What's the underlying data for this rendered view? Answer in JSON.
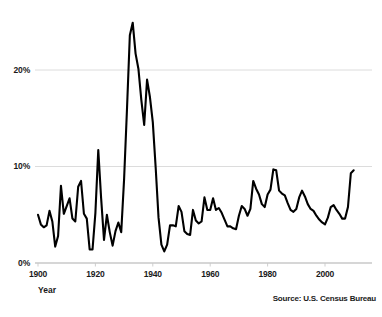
{
  "chart_data": {
    "type": "line",
    "title": "",
    "xlabel": "Year",
    "ylabel": "",
    "xlim": [
      1900,
      2010
    ],
    "ylim": [
      0,
      27
    ],
    "grid": true,
    "legend": "none",
    "source_note": "Source: U.S. Census Bureau",
    "y_tick_labels": [
      "0%",
      "10%",
      "20%"
    ],
    "y_ticks": [
      0,
      10,
      20
    ],
    "x_tick_labels": [
      "1900",
      "1920",
      "1940",
      "1960",
      "1980",
      "2000"
    ],
    "x_ticks": [
      1900,
      1920,
      1940,
      1960,
      1980,
      2000
    ],
    "line_color": "#000000",
    "grid_color": "#d8d8d8",
    "axis_color": "#c9c9c9",
    "series": [
      {
        "name": "Unemployment rate",
        "x": [
          1900,
          1901,
          1902,
          1903,
          1904,
          1905,
          1906,
          1907,
          1908,
          1909,
          1910,
          1911,
          1912,
          1913,
          1914,
          1915,
          1916,
          1917,
          1918,
          1919,
          1920,
          1921,
          1922,
          1923,
          1924,
          1925,
          1926,
          1927,
          1928,
          1929,
          1930,
          1931,
          1932,
          1933,
          1934,
          1935,
          1936,
          1937,
          1938,
          1939,
          1940,
          1941,
          1942,
          1943,
          1944,
          1945,
          1946,
          1947,
          1948,
          1949,
          1950,
          1951,
          1952,
          1953,
          1954,
          1955,
          1956,
          1957,
          1958,
          1959,
          1960,
          1961,
          1962,
          1963,
          1964,
          1965,
          1966,
          1967,
          1968,
          1969,
          1970,
          1971,
          1972,
          1973,
          1974,
          1975,
          1976,
          1977,
          1978,
          1979,
          1980,
          1981,
          1982,
          1983,
          1984,
          1985,
          1986,
          1987,
          1988,
          1989,
          1990,
          1991,
          1992,
          1993,
          1994,
          1995,
          1996,
          1997,
          1998,
          1999,
          2000,
          2001,
          2002,
          2003,
          2004,
          2005,
          2006,
          2007,
          2008,
          2009,
          2010
        ],
        "values": [
          5.0,
          4.0,
          3.7,
          3.9,
          5.4,
          4.3,
          1.7,
          2.8,
          8.0,
          5.1,
          5.9,
          6.7,
          4.6,
          4.3,
          7.9,
          8.5,
          5.1,
          4.6,
          1.4,
          1.4,
          5.2,
          11.7,
          6.7,
          2.4,
          5.0,
          3.2,
          1.8,
          3.3,
          4.2,
          3.2,
          8.7,
          15.9,
          23.6,
          24.9,
          21.7,
          20.1,
          16.9,
          14.3,
          19.0,
          17.2,
          14.6,
          9.9,
          4.7,
          1.9,
          1.2,
          1.9,
          3.9,
          3.9,
          3.8,
          5.9,
          5.3,
          3.3,
          3.0,
          2.9,
          5.5,
          4.4,
          4.1,
          4.3,
          6.8,
          5.5,
          5.5,
          6.7,
          5.5,
          5.7,
          5.2,
          4.5,
          3.8,
          3.8,
          3.6,
          3.5,
          4.9,
          5.9,
          5.6,
          4.9,
          5.6,
          8.5,
          7.7,
          7.1,
          6.1,
          5.8,
          7.1,
          7.6,
          9.7,
          9.6,
          7.5,
          7.2,
          7.0,
          6.2,
          5.5,
          5.3,
          5.6,
          6.8,
          7.5,
          6.9,
          6.1,
          5.6,
          5.4,
          4.9,
          4.5,
          4.2,
          4.0,
          4.7,
          5.8,
          6.0,
          5.5,
          5.1,
          4.6,
          4.6,
          5.8,
          9.3,
          9.6
        ]
      }
    ]
  },
  "axes": {
    "x_title": "Year"
  },
  "footer": {
    "source": "Source: U.S. Census Bureau"
  }
}
